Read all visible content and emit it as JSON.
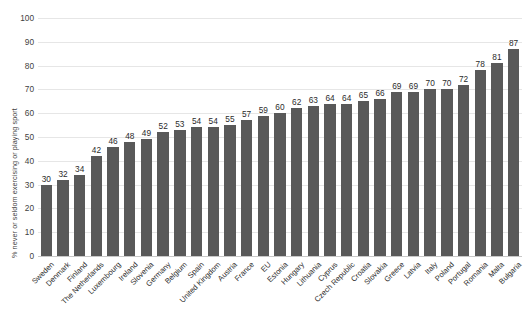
{
  "chart_data": {
    "type": "bar",
    "title": "",
    "xlabel": "",
    "ylabel": "% never or seldom exercising or playing sport",
    "ylim": [
      0,
      100
    ],
    "yticks": [
      0,
      10,
      20,
      30,
      40,
      50,
      60,
      70,
      80,
      90,
      100
    ],
    "grid": true,
    "legend": "none",
    "bar_color": "#595959",
    "categories": [
      "Sweden",
      "Denmark",
      "Finland",
      "The Netherlands",
      "Luxembourg",
      "Ireland",
      "Slovenia",
      "Germany",
      "Belgium",
      "Spain",
      "United Kingdom",
      "Austria",
      "France",
      "EU",
      "Estonia",
      "Hungary",
      "Lithuania",
      "Cyprus",
      "Czech Republic",
      "Croatia",
      "Slovakia",
      "Greece",
      "Latvia",
      "Italy",
      "Poland",
      "Portugal",
      "Romania",
      "Malta",
      "Bulgaria"
    ],
    "values": [
      30,
      32,
      34,
      42,
      46,
      48,
      49,
      52,
      53,
      54,
      54,
      55,
      57,
      59,
      60,
      62,
      63,
      64,
      64,
      65,
      66,
      69,
      69,
      70,
      70,
      72,
      78,
      81,
      87
    ]
  }
}
